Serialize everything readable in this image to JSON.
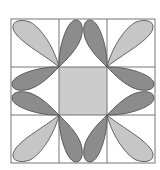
{
  "diagram": {
    "type": "quilt-block",
    "grid": {
      "rows": 3,
      "cols": 3,
      "x0": 11,
      "y0": 19,
      "cell": 48
    },
    "colors": {
      "light_petal": "#c6c6c6",
      "dark_petal": "#8c8c8c",
      "center": "#cccccc",
      "line": "#555555",
      "background": "#ffffff"
    },
    "center_square": {
      "row": 1,
      "col": 1,
      "fill": "center"
    },
    "petals": [
      {
        "name": "corner-petal-top-left",
        "shade": "light"
      },
      {
        "name": "corner-petal-top-right",
        "shade": "light"
      },
      {
        "name": "corner-petal-bottom-left",
        "shade": "light"
      },
      {
        "name": "corner-petal-bottom-right",
        "shade": "light"
      },
      {
        "name": "edge-petal-top-left",
        "shade": "dark"
      },
      {
        "name": "edge-petal-top-right",
        "shade": "dark"
      },
      {
        "name": "edge-petal-bottom-left",
        "shade": "dark"
      },
      {
        "name": "edge-petal-bottom-right",
        "shade": "dark"
      },
      {
        "name": "edge-petal-left-top",
        "shade": "dark"
      },
      {
        "name": "edge-petal-left-bottom",
        "shade": "dark"
      },
      {
        "name": "edge-petal-right-top",
        "shade": "dark"
      },
      {
        "name": "edge-petal-right-bottom",
        "shade": "dark"
      }
    ]
  }
}
